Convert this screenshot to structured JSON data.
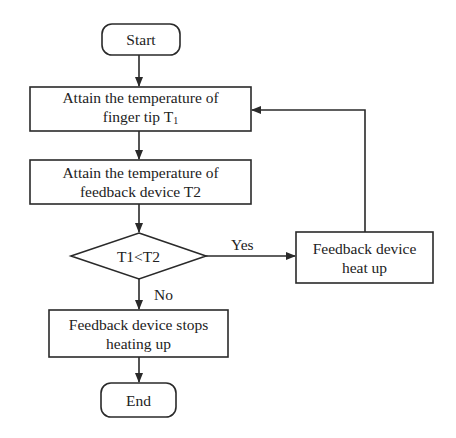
{
  "diagram": {
    "type": "flowchart",
    "nodes": {
      "start": {
        "shape": "terminator",
        "label": "Start"
      },
      "get_t1": {
        "shape": "process",
        "line1": "Attain the temperature of",
        "line2": "finger tip T",
        "line2_sub": "1"
      },
      "get_t2": {
        "shape": "process",
        "line1": "Attain the temperature of",
        "line2": "feedback device T2"
      },
      "decision": {
        "shape": "decision",
        "label": "T1<T2"
      },
      "heat_up": {
        "shape": "process",
        "line1": "Feedback device",
        "line2": "heat up"
      },
      "stop_heating": {
        "shape": "process",
        "line1": "Feedback device stops",
        "line2": "heating up"
      },
      "end": {
        "shape": "terminator",
        "label": "End"
      }
    },
    "edges": [
      {
        "from": "start",
        "to": "get_t1",
        "label": ""
      },
      {
        "from": "get_t1",
        "to": "get_t2",
        "label": ""
      },
      {
        "from": "get_t2",
        "to": "decision",
        "label": ""
      },
      {
        "from": "decision",
        "to": "heat_up",
        "label": "Yes"
      },
      {
        "from": "heat_up",
        "to": "get_t1",
        "label": ""
      },
      {
        "from": "decision",
        "to": "stop_heating",
        "label": "No"
      },
      {
        "from": "stop_heating",
        "to": "end",
        "label": ""
      }
    ],
    "edge_labels": {
      "yes": "Yes",
      "no": "No"
    },
    "colors": {
      "stroke": "#2a2a2a",
      "text": "#222222",
      "background": "#ffffff"
    }
  }
}
